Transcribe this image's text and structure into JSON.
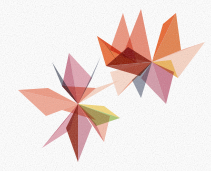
{
  "artwork": {
    "title": "Abstract Overlapping Star Burst",
    "background_color": "#ffffff",
    "canvas": {
      "width": 211,
      "height": 171
    },
    "style": "translucent watercolor facets, multiply blending"
  },
  "palette": {
    "salmon": "#e8836a",
    "coral": "#ec8a70",
    "light_salmon": "#f0a48c",
    "pale_peach": "#f6c9b4",
    "bright_orange": "#e8551a",
    "deep_orange": "#df6a28",
    "maroon": "#8e2010",
    "dark_red": "#9c2b16",
    "rose": "#c2647e",
    "pink": "#d98ea0",
    "mauve": "#c87f92",
    "yellow": "#f2d060",
    "olive_green": "#9bbc55",
    "green": "#8cb04a",
    "slate": "#5c6070",
    "blue_gray": "#6e7487"
  },
  "stars": [
    {
      "name": "upper-right-star",
      "center_x": 152,
      "center_y": 62,
      "outer_radius": 58,
      "inner_radius": 23,
      "points": 8,
      "rotation_deg": 10
    },
    {
      "name": "lower-left-star",
      "center_x": 78,
      "center_y": 104,
      "outer_radius": 60,
      "inner_radius": 24,
      "points": 8,
      "rotation_deg": -6
    }
  ],
  "facets": {
    "upper_star": [
      {
        "name": "spike-up-left-salmon",
        "color": "#ec8a70",
        "opacity": 0.92,
        "pts": "123,13 137,63 110,50"
      },
      {
        "name": "spike-up-center-coral",
        "color": "#e8836a",
        "opacity": 0.95,
        "pts": "141,9 152,62 122,57"
      },
      {
        "name": "spike-up-right-orange",
        "color": "#e8551a",
        "opacity": 0.9,
        "pts": "176,13 152,62 163,24"
      },
      {
        "name": "spike-up-right-fill",
        "color": "#df6a28",
        "opacity": 0.85,
        "pts": "176,13 181,50 152,62"
      },
      {
        "name": "spike-right-peach",
        "color": "#f0a48c",
        "opacity": 0.85,
        "pts": "205,42 152,62 181,50"
      },
      {
        "name": "spike-right-lower-peach",
        "color": "#f6c9b4",
        "opacity": 0.8,
        "pts": "205,42 178,78 152,62"
      },
      {
        "name": "spike-left-upper-salmon",
        "color": "#ef9880",
        "opacity": 0.8,
        "pts": "97,36 137,63 110,50"
      },
      {
        "name": "spike-left-lower-orange",
        "color": "#e8551a",
        "opacity": 0.85,
        "pts": "97,36 106,66 137,63"
      },
      {
        "name": "wedge-maroon-core",
        "color": "#8e2010",
        "opacity": 0.9,
        "pts": "106,66 152,62 128,47"
      },
      {
        "name": "wedge-dark-red",
        "color": "#9c2b16",
        "opacity": 0.85,
        "pts": "106,66 140,76 152,62"
      },
      {
        "name": "wedge-green-left",
        "color": "#8cb04a",
        "opacity": 0.85,
        "pts": "104,42 118,63 110,50"
      },
      {
        "name": "wedge-yellow-right",
        "color": "#f2d060",
        "opacity": 0.85,
        "pts": "178,78 152,62 171,60"
      },
      {
        "name": "spike-down-rose",
        "color": "#c2647e",
        "opacity": 0.85,
        "pts": "166,104 152,62 174,72"
      },
      {
        "name": "spike-down-mauve",
        "color": "#c87f92",
        "opacity": 0.8,
        "pts": "166,104 141,78 152,62"
      },
      {
        "name": "spike-down-slate",
        "color": "#6e7487",
        "opacity": 0.75,
        "pts": "141,98 132,80 152,62"
      },
      {
        "name": "spike-down-left-peach",
        "color": "#f0a48c",
        "opacity": 0.8,
        "pts": "118,96 152,62 132,80"
      },
      {
        "name": "wedge-pale-center",
        "color": "#f6c9b4",
        "opacity": 0.7,
        "pts": "110,72 152,62 118,96"
      }
    ],
    "lower_star": [
      {
        "name": "spike-up-slate",
        "color": "#5c6070",
        "opacity": 0.82,
        "pts": "52,62 78,104 62,86"
      },
      {
        "name": "spike-up-rose",
        "color": "#c2647e",
        "opacity": 0.85,
        "pts": "69,53 78,104 62,86"
      },
      {
        "name": "spike-up-pink",
        "color": "#d98ea0",
        "opacity": 0.8,
        "pts": "69,53 92,78 78,104"
      },
      {
        "name": "spike-up-right-blue",
        "color": "#6e7487",
        "opacity": 0.7,
        "pts": "101,56 92,78 78,104"
      },
      {
        "name": "spike-right-peach",
        "color": "#f6c9b4",
        "opacity": 0.78,
        "pts": "120,80 78,104 96,88"
      },
      {
        "name": "spike-right-yellow",
        "color": "#f2d060",
        "opacity": 0.85,
        "pts": "120,118 78,104 104,106"
      },
      {
        "name": "spike-right-green",
        "color": "#9bbc55",
        "opacity": 0.82,
        "pts": "120,118 96,126 78,104"
      },
      {
        "name": "spike-left-salmon-upper",
        "color": "#ec8a70",
        "opacity": 0.88,
        "pts": "18,90 78,104 48,88"
      },
      {
        "name": "spike-left-salmon-lower",
        "color": "#ef9880",
        "opacity": 0.85,
        "pts": "18,90 46,116 78,104"
      },
      {
        "name": "wedge-orange-left",
        "color": "#e8551a",
        "opacity": 0.85,
        "pts": "46,116 62,110 78,104"
      },
      {
        "name": "core-coral",
        "color": "#e8836a",
        "opacity": 0.9,
        "pts": "62,86 96,88 78,104"
      },
      {
        "name": "core-coral-lower",
        "color": "#ec8a70",
        "opacity": 0.88,
        "pts": "62,110 78,104 96,120"
      },
      {
        "name": "spike-down-left-rose",
        "color": "#c2647e",
        "opacity": 0.85,
        "pts": "42,148 78,104 64,122"
      },
      {
        "name": "spike-down-pink",
        "color": "#d98ea0",
        "opacity": 0.8,
        "pts": "42,148 70,130 78,104"
      },
      {
        "name": "spike-down-maroon",
        "color": "#8e2010",
        "opacity": 0.88,
        "pts": "78,162 78,104 66,128"
      },
      {
        "name": "spike-down-mauve",
        "color": "#c87f92",
        "opacity": 0.82,
        "pts": "78,162 92,126 78,104"
      },
      {
        "name": "spike-down-right-pink",
        "color": "#d98ea0",
        "opacity": 0.78,
        "pts": "104,142 78,104 96,124"
      },
      {
        "name": "spike-down-right-peach",
        "color": "#f0a48c",
        "opacity": 0.75,
        "pts": "104,142 110,116 78,104"
      }
    ]
  }
}
